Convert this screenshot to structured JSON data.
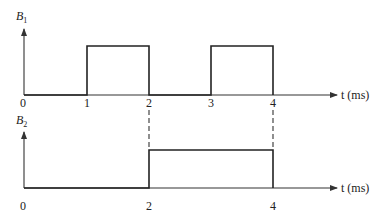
{
  "diagram": {
    "type": "timing-diagram",
    "time_axis_label": "t (ms)",
    "plots": [
      {
        "id": "B1",
        "label_main": "B",
        "label_sub": "1",
        "tick_labels": [
          "0",
          "1",
          "2",
          "3",
          "4"
        ],
        "pulses": [
          {
            "start": 1,
            "end": 2
          },
          {
            "start": 3,
            "end": 4
          }
        ]
      },
      {
        "id": "B2",
        "label_main": "B",
        "label_sub": "2",
        "tick_labels": [
          "0",
          "2",
          "4"
        ],
        "pulses": [
          {
            "start": 2,
            "end": 4
          }
        ]
      }
    ],
    "dashed_guides_at": [
      2,
      4
    ]
  },
  "labels": {
    "b1_main": "B",
    "b1_sub": "1",
    "b2_main": "B",
    "b2_sub": "2",
    "t_axis_1": "t (ms)",
    "t_axis_2": "t (ms)",
    "p1_tick_0": "0",
    "p1_tick_1": "1",
    "p1_tick_2": "2",
    "p1_tick_3": "3",
    "p1_tick_4": "4",
    "p2_tick_0": "0",
    "p2_tick_2": "2",
    "p2_tick_4": "4"
  }
}
